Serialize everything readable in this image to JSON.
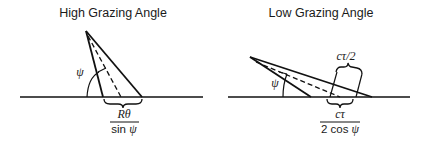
{
  "panels": [
    {
      "title": "High Grazing Angle",
      "angle_label": "ψ",
      "fraction": {
        "numerator": "Rθ",
        "denominator_prefix": "sin ",
        "denominator_symbol": "ψ"
      }
    },
    {
      "title": "Low Grazing Angle",
      "angle_label": "ψ",
      "top_label": "cτ/2",
      "fraction": {
        "numerator": "cτ",
        "denominator_prefix": "2 cos ",
        "denominator_symbol": "ψ"
      }
    }
  ],
  "colors": {
    "stroke": "#111111",
    "background": "#ffffff"
  }
}
